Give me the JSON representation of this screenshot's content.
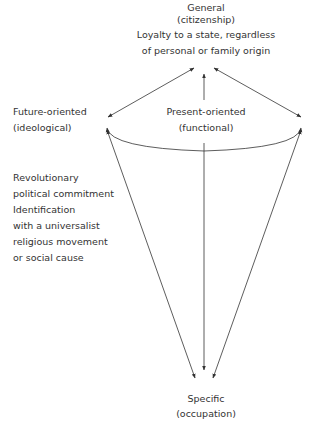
{
  "diagram": {
    "general": {
      "title": "General",
      "subtitle": "(citizenship)",
      "description_lines": [
        "Loyalty to a state, regardless",
        "of personal or family origin"
      ]
    },
    "future": {
      "title": "Future-oriented",
      "subtitle": "(ideological)"
    },
    "present": {
      "title": "Present-oriented",
      "subtitle": "(functional)"
    },
    "future_examples": [
      "Revolutionary",
      "political commitment",
      "Identification",
      "with a universalist",
      "religious movement",
      "or social cause"
    ],
    "specific": {
      "title": "Specific",
      "subtitle": "(occupation)"
    },
    "colors": {
      "line": "#333333",
      "text": "#333333",
      "background": "#ffffff"
    }
  }
}
